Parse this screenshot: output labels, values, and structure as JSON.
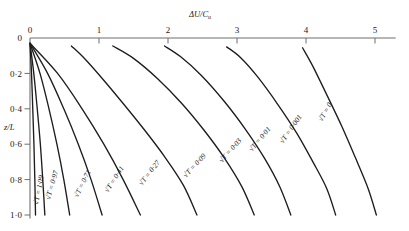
{
  "chart_data": {
    "type": "line",
    "title": "",
    "xlabel": "ΔU/Cᵤ",
    "ylabel": "z/L",
    "xlim": [
      0,
      5.3
    ],
    "ylim": [
      0,
      1.05
    ],
    "y_inverted": true,
    "grid": false,
    "legend_position": "inline-curve-labels",
    "x_axis_position": "top",
    "xticks": [
      0,
      1,
      2,
      3,
      4,
      5
    ],
    "xticklabels": [
      "0",
      "1",
      "2",
      "3",
      "4",
      "5"
    ],
    "yticks": [
      0,
      0.2,
      0.4,
      0.6,
      0.8,
      1.0
    ],
    "yticklabels": [
      "0",
      "0·2",
      "0·4",
      "0·6",
      "0·8",
      "1·0"
    ],
    "series": [
      {
        "name": "√T = 1·09",
        "label": "√T = 1·09",
        "sqrtT": 1.09,
        "points": [
          [
            0.0,
            0.03
          ],
          [
            0.022,
            0.2
          ],
          [
            0.04,
            0.4
          ],
          [
            0.057,
            0.6
          ],
          [
            0.07,
            0.8
          ],
          [
            0.08,
            1.0
          ]
        ]
      },
      {
        "name": "√T = 0·97",
        "label": "√T = 0·97",
        "sqrtT": 0.97,
        "points": [
          [
            0.0,
            0.03
          ],
          [
            0.055,
            0.2
          ],
          [
            0.105,
            0.4
          ],
          [
            0.15,
            0.6
          ],
          [
            0.185,
            0.8
          ],
          [
            0.215,
            1.0
          ]
        ]
      },
      {
        "name": "√T = 0·71",
        "label": "√T = 0·71",
        "sqrtT": 0.71,
        "points": [
          [
            0.0,
            0.03
          ],
          [
            0.145,
            0.2
          ],
          [
            0.275,
            0.4
          ],
          [
            0.39,
            0.6
          ],
          [
            0.49,
            0.8
          ],
          [
            0.575,
            1.0
          ]
        ]
      },
      {
        "name": "√T = 0·41",
        "label": "√T = 0·41",
        "sqrtT": 0.41,
        "points": [
          [
            0.0,
            0.03
          ],
          [
            0.255,
            0.2
          ],
          [
            0.49,
            0.4
          ],
          [
            0.7,
            0.6
          ],
          [
            0.885,
            0.8
          ],
          [
            1.045,
            1.0
          ]
        ]
      },
      {
        "name": "√T = 0·27",
        "label": "√T = 0·27",
        "sqrtT": 0.27,
        "points": [
          [
            0.0,
            0.03
          ],
          [
            0.4,
            0.2
          ],
          [
            0.755,
            0.4
          ],
          [
            1.07,
            0.6
          ],
          [
            1.35,
            0.8
          ],
          [
            1.6,
            1.0
          ]
        ]
      },
      {
        "name": "√T = 0·09",
        "label": "√T = 0·09",
        "sqrtT": 0.09,
        "points": [
          [
            0.6,
            0.045
          ],
          [
            0.8,
            0.12
          ],
          [
            1.05,
            0.23
          ],
          [
            1.35,
            0.37
          ],
          [
            1.66,
            0.52
          ],
          [
            1.95,
            0.67
          ],
          [
            2.22,
            0.83
          ],
          [
            2.42,
            1.0
          ]
        ]
      },
      {
        "name": "√T = 0·03",
        "label": "√T = 0·03",
        "sqrtT": 0.03,
        "points": [
          [
            1.2,
            0.045
          ],
          [
            1.5,
            0.115
          ],
          [
            1.85,
            0.23
          ],
          [
            2.2,
            0.37
          ],
          [
            2.52,
            0.52
          ],
          [
            2.82,
            0.68
          ],
          [
            3.07,
            0.84
          ],
          [
            3.25,
            1.0
          ]
        ]
      },
      {
        "name": "√T = 0·01",
        "label": "√T = 0·01",
        "sqrtT": 0.01,
        "points": [
          [
            1.95,
            0.045
          ],
          [
            2.18,
            0.105
          ],
          [
            2.48,
            0.21
          ],
          [
            2.82,
            0.36
          ],
          [
            3.13,
            0.52
          ],
          [
            3.4,
            0.68
          ],
          [
            3.62,
            0.84
          ],
          [
            3.78,
            1.0
          ]
        ]
      },
      {
        "name": "√T = 0·001",
        "label": "√T = 0·001",
        "sqrtT": 0.001,
        "points": [
          [
            2.85,
            0.05
          ],
          [
            3.05,
            0.11
          ],
          [
            3.3,
            0.22
          ],
          [
            3.6,
            0.38
          ],
          [
            3.87,
            0.54
          ],
          [
            4.1,
            0.7
          ],
          [
            4.3,
            0.85
          ],
          [
            4.43,
            1.0
          ]
        ]
      },
      {
        "name": "√T = 0",
        "label": "√T = 0",
        "sqrtT": 0,
        "points": [
          [
            3.95,
            0.055
          ],
          [
            4.1,
            0.16
          ],
          [
            4.3,
            0.32
          ],
          [
            4.52,
            0.5
          ],
          [
            4.72,
            0.68
          ],
          [
            4.9,
            0.85
          ],
          [
            5.02,
            1.0
          ]
        ]
      }
    ]
  },
  "curve_labels": [
    {
      "text": "√T = 1·09",
      "x": 38,
      "y": 205,
      "rot": -79
    },
    {
      "text": "√T = 0·97",
      "x": 50,
      "y": 200,
      "rot": -74
    },
    {
      "text": "√T = 0·71",
      "x": 78,
      "y": 198,
      "rot": -64
    },
    {
      "text": "√T = 0·41",
      "x": 108,
      "y": 193,
      "rot": -57
    },
    {
      "text": "√T = 0·27",
      "x": 142,
      "y": 186,
      "rot": -52
    },
    {
      "text": "√T = 0·09",
      "x": 186,
      "y": 178,
      "rot": -47
    },
    {
      "text": "√T = 0·03",
      "x": 222,
      "y": 163,
      "rot": -48
    },
    {
      "text": "√T = 0·01",
      "x": 252,
      "y": 152,
      "rot": -50
    },
    {
      "text": "√T = 0·001",
      "x": 283,
      "y": 144,
      "rot": -55
    },
    {
      "text": "√T = 0",
      "x": 322,
      "y": 122,
      "rot": -60
    }
  ],
  "axis": {
    "x_title_main": "ΔU/C",
    "x_title_sub": "u",
    "y_title": "z/L"
  },
  "colors": {
    "curve": "#1d1d1d",
    "axis": "#6f6f6f",
    "background": "#ffffff",
    "text": "#1a1a1a"
  }
}
